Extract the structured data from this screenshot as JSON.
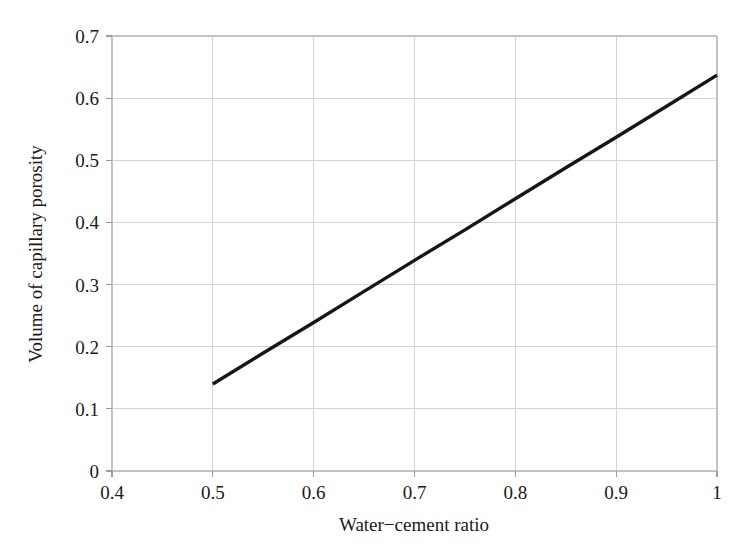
{
  "chart_data": {
    "type": "line",
    "title": "",
    "subtitle": "",
    "xlabel": "Water−cement ratio",
    "ylabel": "Volume of capillary porosity",
    "xlim": [
      0.4,
      1.0
    ],
    "ylim": [
      0,
      0.7
    ],
    "xticks": [
      0.4,
      0.5,
      0.6,
      0.7,
      0.8,
      0.9,
      1.0
    ],
    "xtick_labels": [
      "0.4",
      "0.5",
      "0.6",
      "0.7",
      "0.8",
      "0.9",
      "1"
    ],
    "yticks": [
      0,
      0.1,
      0.2,
      0.3,
      0.4,
      0.5,
      0.6,
      0.7
    ],
    "ytick_labels": [
      "0",
      "0.1",
      "0.2",
      "0.3",
      "0.4",
      "0.5",
      "0.6",
      "0.7"
    ],
    "grid": true,
    "grid_color": "#cfcfd4",
    "legend": null,
    "legend_position": "none",
    "background_color": "#ffffff",
    "series": [
      {
        "name": "Capillary porosity vs water-cement ratio",
        "color": "#161616",
        "line_width": 3.4,
        "x": [
          0.5,
          0.55,
          0.6,
          0.65,
          0.7,
          0.75,
          0.8,
          0.85,
          0.9,
          0.95,
          1.0
        ],
        "values": [
          0.14,
          0.19,
          0.239,
          0.289,
          0.339,
          0.388,
          0.438,
          0.488,
          0.537,
          0.587,
          0.637
        ]
      }
    ],
    "annotations": []
  },
  "labels": {
    "x_axis_title": "Water−cement ratio",
    "y_axis_title": "Volume of capillary porosity"
  }
}
